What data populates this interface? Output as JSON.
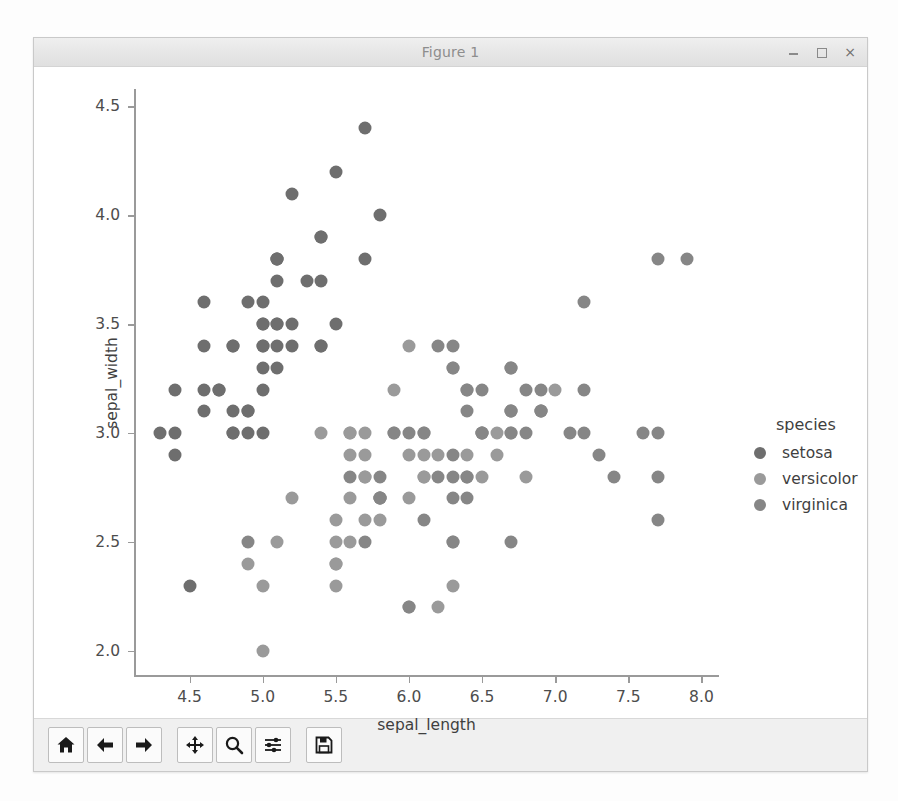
{
  "window": {
    "title": "Figure 1",
    "buttons": [
      {
        "name": "minimize-button",
        "glyph": "minimize-icon"
      },
      {
        "name": "maximize-button",
        "glyph": "maximize-icon"
      },
      {
        "name": "close-button",
        "glyph": "close-icon",
        "label": "×"
      }
    ]
  },
  "toolbar": {
    "items": [
      {
        "name": "home-button",
        "icon": "home-icon",
        "tooltip": "Home"
      },
      {
        "name": "back-button",
        "icon": "arrow-left-icon",
        "tooltip": "Back"
      },
      {
        "name": "forward-button",
        "icon": "arrow-right-icon",
        "tooltip": "Forward"
      },
      {
        "name": "pan-button",
        "icon": "move-cross-icon",
        "tooltip": "Pan"
      },
      {
        "name": "zoom-button",
        "icon": "magnifier-icon",
        "tooltip": "Zoom"
      },
      {
        "name": "configure-subplots-button",
        "icon": "sliders-icon",
        "tooltip": "Configure subplots"
      },
      {
        "name": "save-button",
        "icon": "floppy-disk-icon",
        "tooltip": "Save"
      }
    ]
  },
  "colors": {
    "setosa": "#6e6e6e",
    "versicolor": "#9a9a9a",
    "virginica": "#868686",
    "axis": "#9a9a9a",
    "text": "#3f3f3f",
    "figure_bg": "#ffffff",
    "window_bg": "#f2f2f2"
  },
  "chart_data": {
    "type": "scatter",
    "title": "",
    "xlabel": "sepal_length",
    "ylabel": "sepal_width",
    "xlim": [
      4.12,
      8.12
    ],
    "ylim": [
      1.88,
      4.58
    ],
    "xticks": [
      4.5,
      5.0,
      5.5,
      6.0,
      6.5,
      7.0,
      7.5,
      8.0
    ],
    "yticks": [
      2.0,
      2.5,
      3.0,
      3.5,
      4.0,
      4.5
    ],
    "xticklabels": [
      "4.5",
      "5.0",
      "5.5",
      "6.0",
      "6.5",
      "7.0",
      "7.5",
      "8.0"
    ],
    "yticklabels": [
      "2.0",
      "2.5",
      "3.0",
      "3.5",
      "4.0",
      "4.5"
    ],
    "grid": false,
    "legend": {
      "title": "species",
      "position": "right-outside",
      "entries": [
        "setosa",
        "versicolor",
        "virginica"
      ]
    },
    "series": [
      {
        "name": "setosa",
        "color": "#6e6e6e",
        "x": [
          5.1,
          4.9,
          4.7,
          4.6,
          5.0,
          5.4,
          4.6,
          5.0,
          4.4,
          4.9,
          5.4,
          4.8,
          4.8,
          4.3,
          5.8,
          5.7,
          5.4,
          5.1,
          5.7,
          5.1,
          5.4,
          5.1,
          4.6,
          5.1,
          4.8,
          5.0,
          5.0,
          5.2,
          5.2,
          4.7,
          4.8,
          5.4,
          5.2,
          5.5,
          4.9,
          5.0,
          5.5,
          4.9,
          4.4,
          5.1,
          5.0,
          4.5,
          4.4,
          5.0,
          5.1,
          4.8,
          5.1,
          4.6,
          5.3,
          5.0
        ],
        "y": [
          3.5,
          3.0,
          3.2,
          3.1,
          3.6,
          3.9,
          3.4,
          3.4,
          2.9,
          3.1,
          3.7,
          3.4,
          3.0,
          3.0,
          4.0,
          4.4,
          3.9,
          3.5,
          3.8,
          3.8,
          3.4,
          3.7,
          3.6,
          3.3,
          3.4,
          3.0,
          3.4,
          3.5,
          3.4,
          3.2,
          3.1,
          3.4,
          4.1,
          4.2,
          3.1,
          3.2,
          3.5,
          3.6,
          3.0,
          3.4,
          3.5,
          2.3,
          3.2,
          3.5,
          3.8,
          3.0,
          3.8,
          3.2,
          3.7,
          3.3
        ]
      },
      {
        "name": "versicolor",
        "color": "#9a9a9a",
        "x": [
          7.0,
          6.4,
          6.9,
          5.5,
          6.5,
          5.7,
          6.3,
          4.9,
          6.6,
          5.2,
          5.0,
          5.9,
          6.0,
          6.1,
          5.6,
          6.7,
          5.6,
          5.8,
          6.2,
          5.6,
          5.9,
          6.1,
          6.3,
          6.1,
          6.4,
          6.6,
          6.8,
          6.7,
          6.0,
          5.7,
          5.5,
          5.5,
          5.8,
          6.0,
          5.4,
          6.0,
          6.7,
          6.3,
          5.6,
          5.5,
          5.5,
          6.1,
          5.8,
          5.0,
          5.6,
          5.7,
          5.7,
          6.2,
          5.1,
          5.7
        ],
        "y": [
          3.2,
          3.2,
          3.1,
          2.3,
          2.8,
          2.8,
          3.3,
          2.4,
          2.9,
          2.7,
          2.0,
          3.0,
          2.2,
          2.9,
          2.9,
          3.1,
          3.0,
          2.7,
          2.2,
          2.5,
          3.2,
          2.8,
          2.5,
          2.8,
          2.9,
          3.0,
          2.8,
          3.0,
          2.9,
          2.6,
          2.4,
          2.4,
          2.7,
          2.7,
          3.0,
          3.4,
          3.1,
          2.3,
          3.0,
          2.5,
          2.6,
          3.0,
          2.6,
          2.3,
          2.7,
          3.0,
          2.9,
          2.9,
          2.5,
          2.8
        ]
      },
      {
        "name": "virginica",
        "color": "#868686",
        "x": [
          6.3,
          5.8,
          7.1,
          6.3,
          6.5,
          7.6,
          4.9,
          7.3,
          6.7,
          7.2,
          6.5,
          6.4,
          6.8,
          5.7,
          5.8,
          6.4,
          6.5,
          7.7,
          7.7,
          6.0,
          6.9,
          5.6,
          7.7,
          6.3,
          6.7,
          7.2,
          6.2,
          6.1,
          6.4,
          7.2,
          7.4,
          7.9,
          6.4,
          6.3,
          6.1,
          7.7,
          6.3,
          6.4,
          6.0,
          6.9,
          6.7,
          6.9,
          5.8,
          6.8,
          6.7,
          6.7,
          6.3,
          6.5,
          6.2,
          5.9
        ],
        "y": [
          3.3,
          2.7,
          3.0,
          2.9,
          3.0,
          3.0,
          2.5,
          2.9,
          2.5,
          3.6,
          3.2,
          2.7,
          3.0,
          2.5,
          2.8,
          3.2,
          3.0,
          3.8,
          2.6,
          2.2,
          3.2,
          2.8,
          2.8,
          2.7,
          3.3,
          3.2,
          2.8,
          3.0,
          2.8,
          3.0,
          2.8,
          3.8,
          2.8,
          2.8,
          2.6,
          3.0,
          3.4,
          3.1,
          3.0,
          3.1,
          3.1,
          3.1,
          2.7,
          3.2,
          3.3,
          3.0,
          2.5,
          3.0,
          3.4,
          3.0
        ]
      }
    ]
  }
}
